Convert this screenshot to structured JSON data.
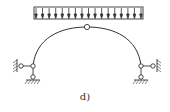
{
  "figure": {
    "label": "d)",
    "load": {
      "type": "uniform-distributed",
      "arrow_count": 17,
      "direction": "down"
    },
    "arch": {
      "crown_hinge": true,
      "left_support": "pinned (two-link)",
      "right_support": "pinned (two-link)"
    },
    "colors": {
      "line": "#333333",
      "background": "#ffffff"
    }
  }
}
